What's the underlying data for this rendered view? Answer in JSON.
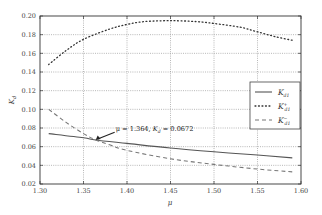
{
  "chart_data": {
    "type": "line",
    "title": "",
    "xlabel": "μ",
    "ylabel": "K_d",
    "xlim": [
      1.3,
      1.6
    ],
    "ylim": [
      0.02,
      0.2
    ],
    "xticks": [
      "1.30",
      "1.35",
      "1.40",
      "1.45",
      "1.50",
      "1.55",
      "1.60"
    ],
    "yticks": [
      "0.02",
      "0.04",
      "0.06",
      "0.08",
      "0.10",
      "0.12",
      "0.14",
      "0.16",
      "0.18",
      "0.20"
    ],
    "grid": true,
    "legend_position": "center right",
    "series": [
      {
        "name": "K_d1",
        "label_main": "K",
        "label_sub": "d1",
        "label_sup": "",
        "style": "solid",
        "x": [
          1.31,
          1.35,
          1.364,
          1.4,
          1.45,
          1.5,
          1.55,
          1.59
        ],
        "y": [
          0.074,
          0.0695,
          0.0672,
          0.0635,
          0.0585,
          0.0545,
          0.051,
          0.048
        ]
      },
      {
        "name": "K_d1^+",
        "label_main": "K",
        "label_sub": "d1",
        "label_sup": "+",
        "style": "dotted",
        "x": [
          1.31,
          1.33,
          1.35,
          1.38,
          1.4,
          1.42,
          1.45,
          1.48,
          1.5,
          1.53,
          1.55,
          1.57,
          1.59
        ],
        "y": [
          0.148,
          0.163,
          0.175,
          0.186,
          0.191,
          0.194,
          0.195,
          0.194,
          0.192,
          0.188,
          0.183,
          0.178,
          0.174
        ]
      },
      {
        "name": "K_d1^-",
        "label_main": "K",
        "label_sub": "d1",
        "label_sup": "−",
        "style": "dashed",
        "x": [
          1.31,
          1.33,
          1.35,
          1.364,
          1.38,
          1.4,
          1.45,
          1.5,
          1.55,
          1.59
        ],
        "y": [
          0.1,
          0.086,
          0.074,
          0.0672,
          0.062,
          0.056,
          0.047,
          0.041,
          0.036,
          0.033
        ]
      }
    ],
    "annotations": [
      {
        "text": "μ = 1.364,  K_d = 0.0672",
        "text_parts": {
          "a": "μ = 1.364,  ",
          "b": "K",
          "sub": "d",
          "c": " = 0.0672"
        },
        "point": [
          1.364,
          0.0672
        ],
        "text_pos": [
          1.387,
          0.0765
        ]
      }
    ]
  }
}
